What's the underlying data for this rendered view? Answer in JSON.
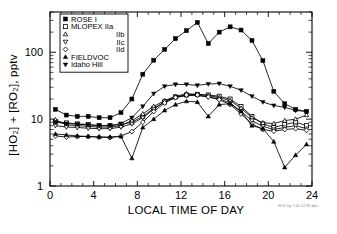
{
  "chart_data": {
    "type": "line",
    "title": "",
    "xlabel": "LOCAL TIME OF DAY",
    "ylabel": "[HO₂] + [RO₂], pptv",
    "yscale": "log",
    "xlim": [
      0,
      24
    ],
    "ylim": [
      1,
      400
    ],
    "grid": false,
    "legend_position": "top-left-inside",
    "xticks": [
      0,
      4,
      8,
      12,
      16,
      20,
      24
    ],
    "xtick_labels": [
      "0",
      "4",
      "8",
      "12",
      "16",
      "20",
      "24"
    ],
    "yticks": [
      1,
      10,
      100
    ],
    "ytick_labels": [
      "1",
      "10",
      "100"
    ],
    "series": [
      {
        "name": "ROSE I",
        "marker": "filled-square",
        "x": [
          0.5,
          1.5,
          2.5,
          3.5,
          4.5,
          5.5,
          6.5,
          7.5,
          8.5,
          9.5,
          10.5,
          11.5,
          12.5,
          13.5,
          14.5,
          15.5,
          16.5,
          17.5,
          18.5,
          19.5,
          20.5,
          21.5,
          22.5,
          23.5
        ],
        "values": [
          14.0,
          11.5,
          11.0,
          11.0,
          10.5,
          10.5,
          12.5,
          20.0,
          47.0,
          76.0,
          110.0,
          160.0,
          210.0,
          280.0,
          135.0,
          200.0,
          240.0,
          215.0,
          150.0,
          75.0,
          26.0,
          17.0,
          14.0,
          13.0
        ]
      },
      {
        "name": "MLOPEX IIa",
        "marker": "open-square",
        "x": [
          0.5,
          1.5,
          2.5,
          3.5,
          4.5,
          5.5,
          6.5,
          7.5,
          8.5,
          9.5,
          10.5,
          11.5,
          12.5,
          13.5,
          14.5,
          15.5,
          16.5,
          17.5,
          18.5,
          19.5,
          20.5,
          21.5,
          22.5,
          23.5
        ],
        "values": [
          9.2,
          8.8,
          8.5,
          8.3,
          8.0,
          8.0,
          8.3,
          9.0,
          11.0,
          14.5,
          18.0,
          21.5,
          23.0,
          23.5,
          23.0,
          22.0,
          20.0,
          15.5,
          11.0,
          8.5,
          7.5,
          8.3,
          9.0,
          8.0
        ]
      },
      {
        "name": "MLOPEX IIb",
        "marker": "open-triangle-up",
        "x": [
          0.5,
          1.5,
          2.5,
          3.5,
          4.5,
          5.5,
          6.5,
          7.5,
          8.5,
          9.5,
          10.5,
          11.5,
          12.5,
          13.5,
          14.5,
          15.5,
          16.5,
          17.5,
          18.5,
          19.5,
          20.5,
          21.5,
          22.5,
          23.5
        ],
        "values": [
          9.8,
          8.2,
          8.0,
          7.8,
          7.6,
          7.6,
          8.0,
          9.5,
          12.0,
          15.5,
          19.0,
          22.0,
          24.0,
          23.5,
          22.5,
          21.0,
          19.0,
          14.5,
          10.5,
          8.8,
          8.6,
          9.5,
          10.0,
          11.5
        ]
      },
      {
        "name": "MLOPEX IIc",
        "marker": "open-triangle-down",
        "x": [
          0.5,
          1.5,
          2.5,
          3.5,
          4.5,
          5.5,
          6.5,
          7.5,
          8.5,
          9.5,
          10.5,
          11.5,
          12.5,
          13.5,
          14.5,
          15.5,
          16.5,
          17.5,
          18.5,
          19.5,
          20.5,
          21.5,
          22.5,
          23.5
        ],
        "values": [
          8.0,
          7.6,
          7.5,
          7.3,
          7.2,
          7.2,
          7.6,
          8.5,
          10.5,
          14.0,
          18.5,
          21.0,
          22.5,
          22.5,
          21.5,
          20.0,
          17.5,
          13.0,
          9.5,
          7.8,
          7.0,
          7.5,
          8.0,
          7.2
        ]
      },
      {
        "name": "MLOPEX IId",
        "marker": "open-diamond",
        "x": [
          0.5,
          1.5,
          2.5,
          3.5,
          4.5,
          5.5,
          6.5,
          7.5,
          8.5,
          9.5,
          10.5,
          11.5,
          12.5,
          13.5,
          14.5,
          15.5,
          16.5,
          17.5,
          18.5,
          19.5,
          20.5,
          21.5,
          22.5,
          23.5
        ],
        "values": [
          5.6,
          5.4,
          5.5,
          5.5,
          5.4,
          5.3,
          5.6,
          6.5,
          9.0,
          13.0,
          17.5,
          21.0,
          23.0,
          23.0,
          21.5,
          19.5,
          16.5,
          12.0,
          8.5,
          7.0,
          6.6,
          7.0,
          7.2,
          6.8
        ]
      },
      {
        "name": "FIELDVOC",
        "marker": "filled-triangle-up",
        "x": [
          0.5,
          1.5,
          2.5,
          3.5,
          4.5,
          5.5,
          6.5,
          7.5,
          8.5,
          9.5,
          10.5,
          11.5,
          12.5,
          13.5,
          14.5,
          15.5,
          16.5,
          17.5,
          18.5,
          19.5,
          20.5,
          21.5,
          22.5,
          23.5
        ],
        "values": [
          6.0,
          5.8,
          5.6,
          5.5,
          5.4,
          5.4,
          5.5,
          2.6,
          7.5,
          10.0,
          13.5,
          16.5,
          18.5,
          18.0,
          11.0,
          16.5,
          17.0,
          13.0,
          8.0,
          7.2,
          4.6,
          1.9,
          2.9,
          4.2
        ]
      },
      {
        "name": "Idaho Hill",
        "marker": "filled-triangle-down",
        "x": [
          0.5,
          1.5,
          2.5,
          3.5,
          4.5,
          5.5,
          6.5,
          7.5,
          8.5,
          9.5,
          10.5,
          11.5,
          12.5,
          13.5,
          14.5,
          15.5,
          16.5,
          17.5,
          18.5,
          19.5,
          20.5,
          21.5,
          22.5,
          23.5
        ],
        "values": [
          9.0,
          8.6,
          8.4,
          8.2,
          8.0,
          8.0,
          8.6,
          10.5,
          15.5,
          24.0,
          31.0,
          33.0,
          33.0,
          32.0,
          33.5,
          34.0,
          31.0,
          27.0,
          22.0,
          18.0,
          16.0,
          15.0,
          13.5,
          13.0
        ]
      }
    ]
  },
  "legend": {
    "entries": [
      {
        "label": "ROSE I",
        "marker": "filled-square",
        "align": "left"
      },
      {
        "label": "MLOPEX IIa",
        "marker": "open-square",
        "align": "left"
      },
      {
        "label": "IIb",
        "marker": "open-triangle-up",
        "align": "right"
      },
      {
        "label": "IIc",
        "marker": "open-triangle-down",
        "align": "right"
      },
      {
        "label": "IId",
        "marker": "open-diamond",
        "align": "right"
      },
      {
        "label": "FIELDVOC",
        "marker": "filled-triangle-up",
        "align": "left"
      },
      {
        "label": "Idaho Hill",
        "marker": "filled-triangle-down",
        "align": "left"
      }
    ]
  },
  "footer": {
    "watermark": "HO2 fig 7.00 12.95  dpn"
  },
  "colors": {
    "ink": "#000000",
    "background": "#ffffff"
  }
}
